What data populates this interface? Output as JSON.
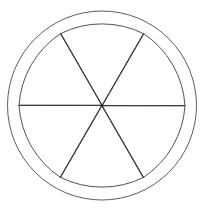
{
  "figure": {
    "title": "Six-petal rosette inscribed in a circle",
    "type": "geometric-line-drawing",
    "background_color": "#ffffff",
    "canvas": {
      "width": 204,
      "height": 211
    },
    "stroke": {
      "color": "#3c3c46",
      "width": 0.9,
      "linejoin": "round",
      "linecap": "round"
    },
    "center": {
      "x": 102,
      "y": 105.5,
      "label": "center-point"
    },
    "center_dot": {
      "radius": 1.6,
      "color": "#2a2a33",
      "label": "center-dot"
    },
    "outer_circle": {
      "label": "outer-circle",
      "cx": 102,
      "cy": 105.5,
      "r": 94.5,
      "stroke_color": "#4a4a55",
      "stroke_width": 0.9
    },
    "petals": {
      "count": 6,
      "angle_step_deg": 60,
      "first_petal_axis_deg": -90,
      "tip_radius": 83,
      "half_angle_deg": 30,
      "bulge_radius": 93,
      "description": "Each petal is a teardrop: two straight chords run from the center out to two junction points 60 degrees apart on a circle of radius 83, joined by an outward-bulging circular arc that nearly touches the outer circle."
    },
    "spokes": {
      "count": 6,
      "label": "radial-spoke",
      "angles_deg": [
        0,
        60,
        120,
        180,
        240,
        300
      ],
      "length": 83,
      "description": "Six straight radial lines from the center to each petal junction point; these are the shared straight edges of adjacent petals."
    },
    "junction_points_deg": [
      0,
      60,
      120,
      180,
      240,
      300
    ]
  }
}
